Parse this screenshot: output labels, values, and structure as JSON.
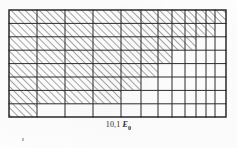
{
  "figure": {
    "caption": {
      "number": "10,1",
      "symbol": "E",
      "subscript": "0",
      "full_text": "10,1 E0"
    },
    "plot_area": {
      "x": 9,
      "y": 10,
      "width": 217,
      "height": 107,
      "border_color": "#1c1c1c",
      "border_width": 1.4
    },
    "style": {
      "grid_line_color": "#2a2a2a",
      "grid_line_width": 1.0,
      "hatch_color": "#3a3a3a",
      "hatch_width": 0.9,
      "hatch_angle_deg": 45,
      "hatch_spacing": 5,
      "background": "#fefefe",
      "ink_color": "#2b2b2b"
    },
    "chart_data": {
      "type": "heatmap",
      "title": "10,1 E0",
      "xlabel": "",
      "ylabel": "",
      "grid": true,
      "legend": "none",
      "description": "Rectangular grid with non-uniform (log-like) vertical divisions, uniform horizontal divisions; a staircase-bounded region is filled with 45-degree diagonal hatching descending from upper-right toward lower-left.",
      "x_gridlines": [
        9,
        37,
        65,
        93,
        121,
        141,
        158,
        172,
        185,
        196,
        206,
        215,
        226
      ],
      "y_gridlines": [
        10,
        23.4,
        36.8,
        50.2,
        63.6,
        77,
        90.4,
        103.8,
        117
      ],
      "x_columns": 12,
      "y_rows": 8,
      "xlim": [
        9,
        226
      ],
      "ylim": [
        10,
        117
      ],
      "hatch_staircase": [
        {
          "row": 0,
          "x_start": 9,
          "x_end": 226
        },
        {
          "row": 1,
          "x_start": 9,
          "x_end": 215
        },
        {
          "row": 2,
          "x_start": 9,
          "x_end": 196
        },
        {
          "row": 3,
          "x_start": 9,
          "x_end": 172
        },
        {
          "row": 4,
          "x_start": 9,
          "x_end": 158
        },
        {
          "row": 5,
          "x_start": 9,
          "x_end": 141
        },
        {
          "row": 6,
          "x_start": 9,
          "x_end": 121
        },
        {
          "row": 7,
          "x_start": 9,
          "x_end": 37
        }
      ],
      "categories": [
        "c1",
        "c2",
        "c3",
        "c4",
        "c5",
        "c6",
        "c7",
        "c8",
        "c9",
        "c10",
        "c11",
        "c12"
      ],
      "values": [
        8,
        8,
        8,
        8,
        7,
        6,
        5,
        4,
        3,
        3,
        2,
        1
      ]
    }
  }
}
